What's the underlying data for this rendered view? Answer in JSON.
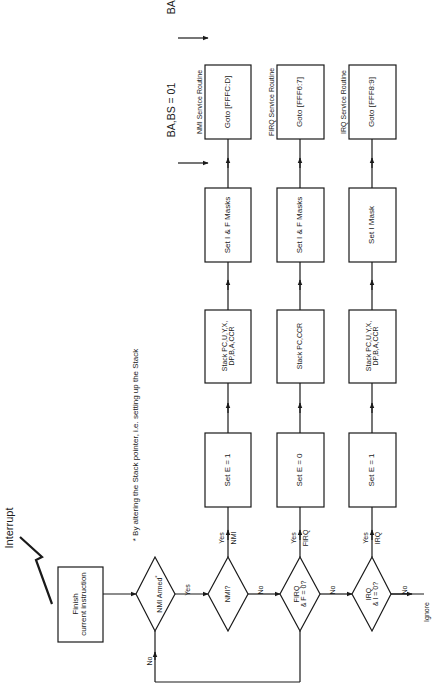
{
  "diagram": {
    "orientation": "rotated-90-ccw",
    "interrupt_label": "Interrupt",
    "footnote": "* By altering the Stack pointer, i.e. setting up the Stack",
    "start_box": {
      "line1": "Finish",
      "line2": "current instruction"
    },
    "nmi_armed_decision": {
      "label": "NMI Armed",
      "asterisk": "*",
      "yes": "Yes",
      "no": "No"
    },
    "bus_status": [
      {
        "label": "BA,BS = 01"
      },
      {
        "label": "BA,BS = 00"
      }
    ],
    "rows": [
      {
        "id": "nmi",
        "decision": {
          "line1": "NMI?",
          "line2": ""
        },
        "yes_label": "Yes",
        "yes_sub": "NMI",
        "no_label": "No",
        "set_e": "Set E = 1",
        "stack": {
          "line1": "Stack PC,U,Y,X,",
          "line2": "DP,B,A,CCR"
        },
        "masks": "Set I & F Masks",
        "routine_title": "NMI Service Routine",
        "goto": "Goto [FFFC:D]"
      },
      {
        "id": "firq",
        "decision": {
          "line1": "FIRQ",
          "line2": "& F = 0?"
        },
        "yes_label": "Yes",
        "yes_sub": "FIRQ",
        "no_label": "No",
        "set_e": "Set E = 0",
        "stack": {
          "line1": "Stack PC,CCR",
          "line2": ""
        },
        "masks": "Set I & F Masks",
        "routine_title": "FIRQ Service Routine",
        "goto": "Goto [FFF6:7]"
      },
      {
        "id": "irq",
        "decision": {
          "line1": "IRQ",
          "line2": "& I = 0?"
        },
        "yes_label": "Yes",
        "yes_sub": "IRQ",
        "no_label": "No",
        "set_e": "Set E = 1",
        "stack": {
          "line1": "Stack PC,U,Y,X,",
          "line2": "DP,B,A,CCR"
        },
        "masks": "Set I Mask",
        "routine_title": "IRQ Service Routine",
        "goto": "Goto [FFF8:9]"
      }
    ],
    "ignore_label": "Ignore",
    "colors": {
      "line": "#1a1a1a",
      "background": "#ffffff"
    }
  }
}
